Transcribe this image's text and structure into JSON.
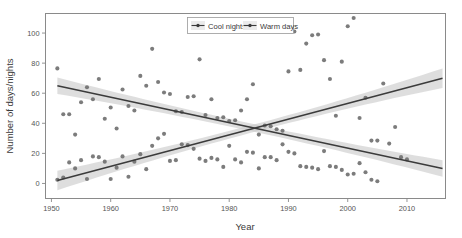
{
  "chart_data": {
    "type": "scatter",
    "title": "",
    "subtitle": "",
    "xlabel": "Year",
    "ylabel": "Number of days/nights",
    "xlim": [
      1949,
      2016.5
    ],
    "ylim": [
      -10,
      113
    ],
    "xticks": [
      1950,
      1960,
      1970,
      1980,
      1990,
      2000,
      2010
    ],
    "xtick_labels": [
      "1950",
      "1960",
      "1970",
      "1980",
      "1990",
      "2000",
      "2010"
    ],
    "yticks": [
      0,
      20,
      40,
      60,
      80,
      100
    ],
    "ytick_labels": [
      "0",
      "20",
      "40",
      "60",
      "80",
      "100"
    ],
    "grid": false,
    "legend_position": "top-center",
    "point_color": "#6e6e6e",
    "line_color": "#3b3b3b",
    "band_color": "#c9c9c9",
    "frame_color": "#8a8a8a",
    "series": [
      {
        "name": "Cool nights",
        "marker": "circle",
        "trend": {
          "type": "linear",
          "x_start": 1951,
          "y_start": 65,
          "x_end": 2016,
          "y_end": 10,
          "band_halfwidth_start": 5.5,
          "band_halfwidth_mid": 2.5,
          "band_halfwidth_end": 5.5
        },
        "points": [
          [
            1951,
            76.5
          ],
          [
            1952,
            46
          ],
          [
            1953,
            46
          ],
          [
            1954,
            32.5
          ],
          [
            1955,
            54
          ],
          [
            1956,
            64
          ],
          [
            1957,
            56
          ],
          [
            1958,
            69.5
          ],
          [
            1959,
            43
          ],
          [
            1960,
            50.5
          ],
          [
            1961,
            36.5
          ],
          [
            1962,
            62.5
          ],
          [
            1963,
            51.5
          ],
          [
            1964,
            48.5
          ],
          [
            1965,
            71.5
          ],
          [
            1966,
            65
          ],
          [
            1967,
            89.5
          ],
          [
            1968,
            67.5
          ],
          [
            1969,
            60.5
          ],
          [
            1970,
            59.5
          ],
          [
            1971,
            48
          ],
          [
            1972,
            47.5
          ],
          [
            1973,
            57.5
          ],
          [
            1974,
            58
          ],
          [
            1975,
            82.5
          ],
          [
            1976,
            45.5
          ],
          [
            1977,
            56
          ],
          [
            1978,
            43.5
          ],
          [
            1979,
            44
          ],
          [
            1980,
            41.5
          ],
          [
            1981,
            42
          ],
          [
            1982,
            48.5
          ],
          [
            1983,
            56
          ],
          [
            1984,
            66
          ],
          [
            1985,
            32.5
          ],
          [
            1986,
            38.5
          ],
          [
            1987,
            38
          ],
          [
            1988,
            36
          ],
          [
            1989,
            35
          ],
          [
            1990,
            74.5
          ],
          [
            1991,
            101
          ],
          [
            1992,
            75.5
          ],
          [
            1993,
            93
          ],
          [
            1994,
            98.5
          ],
          [
            1995,
            99
          ],
          [
            1996,
            82
          ],
          [
            1997,
            69.5
          ],
          [
            1998,
            45
          ],
          [
            1999,
            81
          ],
          [
            2000,
            104.5
          ],
          [
            2001,
            110
          ],
          [
            2002,
            43.5
          ],
          [
            2003,
            57
          ],
          [
            2004,
            28.5
          ],
          [
            2005,
            28.5
          ],
          [
            2006,
            66.5
          ],
          [
            2007,
            26.5
          ],
          [
            2008,
            37.5
          ],
          [
            2009,
            17.5
          ],
          [
            2010,
            16
          ]
        ]
      },
      {
        "name": "Warm days",
        "marker": "circle",
        "trend": {
          "type": "linear",
          "x_start": 1951,
          "y_start": 2,
          "x_end": 2016,
          "y_end": 70,
          "band_halfwidth_start": 6.5,
          "band_halfwidth_mid": 2.5,
          "band_halfwidth_end": 6.5
        },
        "points": [
          [
            1951,
            2.5
          ],
          [
            1952,
            4
          ],
          [
            1953,
            14
          ],
          [
            1954,
            10
          ],
          [
            1955,
            15.5
          ],
          [
            1956,
            3
          ],
          [
            1957,
            18
          ],
          [
            1958,
            17.5
          ],
          [
            1959,
            14.5
          ],
          [
            1960,
            3
          ],
          [
            1961,
            10.5
          ],
          [
            1962,
            18
          ],
          [
            1963,
            4.5
          ],
          [
            1964,
            14.5
          ],
          [
            1965,
            19.5
          ],
          [
            1966,
            9.5
          ],
          [
            1967,
            25
          ],
          [
            1968,
            30
          ],
          [
            1969,
            33
          ],
          [
            1970,
            15
          ],
          [
            1971,
            15.5
          ],
          [
            1972,
            26
          ],
          [
            1973,
            25.5
          ],
          [
            1974,
            23
          ],
          [
            1975,
            16.5
          ],
          [
            1976,
            15
          ],
          [
            1977,
            17
          ],
          [
            1978,
            16
          ],
          [
            1979,
            11
          ],
          [
            1980,
            25
          ],
          [
            1981,
            16
          ],
          [
            1982,
            14
          ],
          [
            1983,
            21
          ],
          [
            1984,
            20.5
          ],
          [
            1985,
            10
          ],
          [
            1986,
            17.5
          ],
          [
            1987,
            17.5
          ],
          [
            1988,
            15.5
          ],
          [
            1989,
            26
          ],
          [
            1990,
            21
          ],
          [
            1991,
            20
          ],
          [
            1992,
            11.5
          ],
          [
            1993,
            11
          ],
          [
            1994,
            10.5
          ],
          [
            1995,
            9.5
          ],
          [
            1996,
            21.5
          ],
          [
            1997,
            11.5
          ],
          [
            1998,
            11
          ],
          [
            1999,
            9
          ],
          [
            2000,
            6
          ],
          [
            2001,
            6.5
          ],
          [
            2002,
            13.5
          ],
          [
            2003,
            7.5
          ],
          [
            2004,
            2.5
          ],
          [
            2005,
            1.5
          ]
        ]
      }
    ]
  },
  "legend": {
    "entries": [
      {
        "label": "Cool nights"
      },
      {
        "label": "Warm days"
      }
    ]
  },
  "axes": {
    "x_title": "Year",
    "y_title": "Number of days/nights"
  }
}
